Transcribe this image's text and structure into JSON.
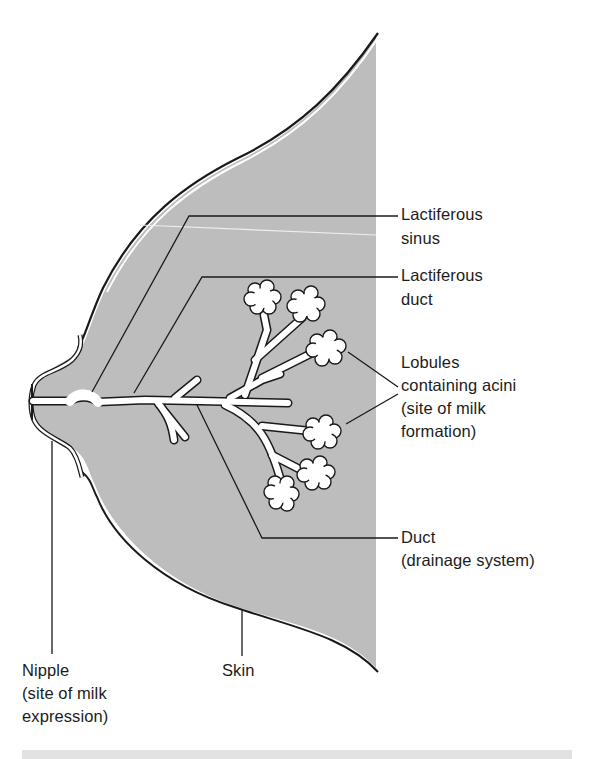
{
  "figure": {
    "colors": {
      "tissue_fill": "#bdbdbd",
      "outline": "#1a1a1a",
      "ducts": "#ffffff",
      "label_text": "#1c1c1c",
      "bottom_band": "#e2e2e2"
    }
  },
  "labels": {
    "lactiferous_sinus": {
      "line1": "Lactiferous",
      "line2": "sinus"
    },
    "lactiferous_duct": {
      "line1": "Lactiferous",
      "line2": "duct"
    },
    "lobules": {
      "line1": "Lobules",
      "line2": "containing acini",
      "line3": "(site of milk",
      "line4": "formation)"
    },
    "duct": {
      "line1": "Duct",
      "line2": "(drainage system)"
    },
    "nipple": {
      "line1": "Nipple",
      "line2": "(site of milk",
      "line3": "expression)"
    },
    "skin": {
      "line1": "Skin"
    }
  }
}
